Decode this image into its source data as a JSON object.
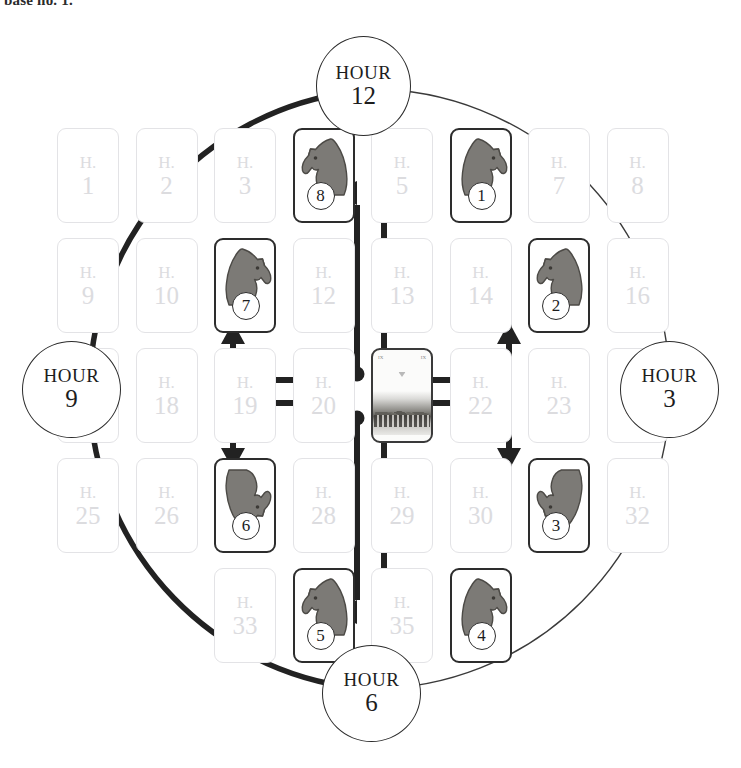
{
  "caption": {
    "text": "base no. 1."
  },
  "diagram": {
    "colors": {
      "ink": "#2b2b2b",
      "card_border_inactive": "#e3e3e6",
      "card_text_inactive": "#dcdcdf",
      "card_border_active": "#2d2d2d",
      "knight_fill": "#7c7a76"
    }
  },
  "hours": [
    {
      "id": "hour12",
      "word": "HOUR",
      "number": "12"
    },
    {
      "id": "hour3",
      "word": "HOUR",
      "number": "3"
    },
    {
      "id": "hour6",
      "word": "HOUR",
      "number": "6"
    },
    {
      "id": "hour9",
      "word": "HOUR",
      "number": "9"
    }
  ],
  "grid": {
    "columns": 8,
    "rows": 5,
    "card_prefix": "H.",
    "cards": [
      {
        "n": "1",
        "col": 1,
        "row": 1,
        "state": "inactive"
      },
      {
        "n": "2",
        "col": 2,
        "row": 1,
        "state": "inactive"
      },
      {
        "n": "3",
        "col": 3,
        "row": 1,
        "state": "inactive"
      },
      {
        "n": "4",
        "col": 4,
        "row": 1,
        "state": "knight",
        "knight": "8",
        "facing": "left",
        "flip": "up"
      },
      {
        "n": "5",
        "col": 5,
        "row": 1,
        "state": "inactive"
      },
      {
        "n": "6",
        "col": 6,
        "row": 1,
        "state": "knight",
        "knight": "1",
        "facing": "right",
        "flip": "up"
      },
      {
        "n": "7",
        "col": 7,
        "row": 1,
        "state": "inactive"
      },
      {
        "n": "8",
        "col": 8,
        "row": 1,
        "state": "inactive"
      },
      {
        "n": "9",
        "col": 1,
        "row": 2,
        "state": "inactive"
      },
      {
        "n": "10",
        "col": 2,
        "row": 2,
        "state": "inactive"
      },
      {
        "n": "11",
        "col": 3,
        "row": 2,
        "state": "knight",
        "knight": "7",
        "facing": "right",
        "flip": "up"
      },
      {
        "n": "12",
        "col": 4,
        "row": 2,
        "state": "inactive"
      },
      {
        "n": "13",
        "col": 5,
        "row": 2,
        "state": "inactive"
      },
      {
        "n": "14",
        "col": 6,
        "row": 2,
        "state": "inactive"
      },
      {
        "n": "15",
        "col": 7,
        "row": 2,
        "state": "knight",
        "knight": "2",
        "facing": "left",
        "flip": "up"
      },
      {
        "n": "16",
        "col": 8,
        "row": 2,
        "state": "inactive"
      },
      {
        "n": "17",
        "col": 1,
        "row": 3,
        "state": "inactive"
      },
      {
        "n": "18",
        "col": 2,
        "row": 3,
        "state": "inactive"
      },
      {
        "n": "19",
        "col": 3,
        "row": 3,
        "state": "inactive"
      },
      {
        "n": "20",
        "col": 4,
        "row": 3,
        "state": "inactive"
      },
      {
        "n": "21",
        "col": 5,
        "row": 3,
        "state": "center"
      },
      {
        "n": "22",
        "col": 6,
        "row": 3,
        "state": "inactive"
      },
      {
        "n": "23",
        "col": 7,
        "row": 3,
        "state": "inactive"
      },
      {
        "n": "24",
        "col": 8,
        "row": 3,
        "state": "inactive"
      },
      {
        "n": "25",
        "col": 1,
        "row": 4,
        "state": "inactive"
      },
      {
        "n": "26",
        "col": 2,
        "row": 4,
        "state": "inactive"
      },
      {
        "n": "27",
        "col": 3,
        "row": 4,
        "state": "knight",
        "knight": "6",
        "facing": "right",
        "flip": "down"
      },
      {
        "n": "28",
        "col": 4,
        "row": 4,
        "state": "inactive"
      },
      {
        "n": "29",
        "col": 5,
        "row": 4,
        "state": "inactive"
      },
      {
        "n": "30",
        "col": 6,
        "row": 4,
        "state": "inactive"
      },
      {
        "n": "31",
        "col": 7,
        "row": 4,
        "state": "knight",
        "knight": "3",
        "facing": "left",
        "flip": "down"
      },
      {
        "n": "32",
        "col": 8,
        "row": 4,
        "state": "inactive"
      },
      {
        "n": "33",
        "col": 3,
        "row": 5,
        "state": "inactive"
      },
      {
        "n": "34",
        "col": 4,
        "row": 5,
        "state": "knight",
        "knight": "5",
        "facing": "left",
        "flip": "up"
      },
      {
        "n": "35",
        "col": 5,
        "row": 5,
        "state": "inactive"
      },
      {
        "n": "36",
        "col": 6,
        "row": 5,
        "state": "knight",
        "knight": "4",
        "facing": "right",
        "flip": "up"
      }
    ]
  },
  "connectors": {
    "count": 8,
    "description": "Eight arrows leave the eight dots on the central card and terminate at the eight numbered knights.",
    "dots": 8
  }
}
